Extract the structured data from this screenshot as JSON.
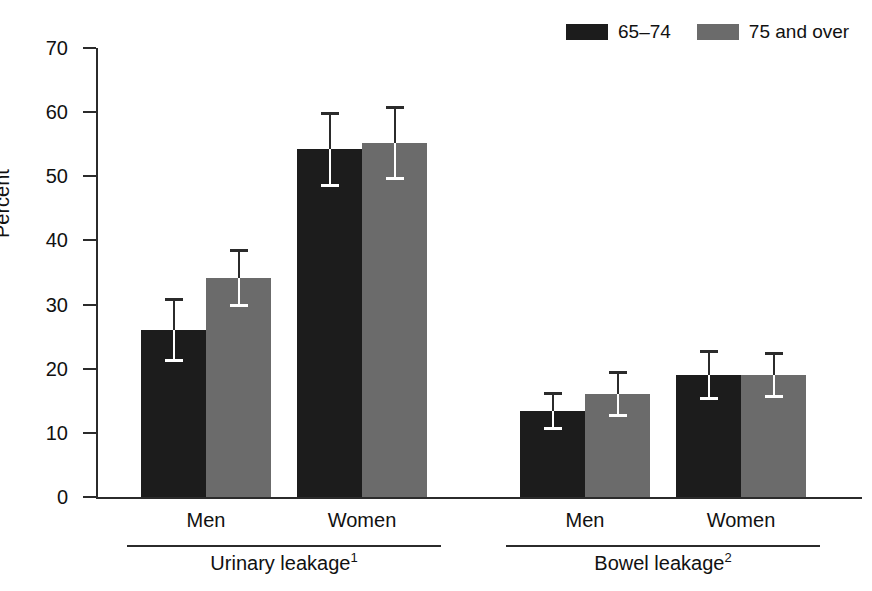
{
  "chart_data": {
    "type": "bar",
    "title": "",
    "subtitle": "",
    "xlabel": "",
    "ylabel": "Percent",
    "ylim": [
      0,
      70
    ],
    "yticks": [
      0,
      10,
      20,
      30,
      40,
      50,
      60,
      70
    ],
    "ytick_labels": [
      "0",
      "10",
      "20",
      "30",
      "40",
      "50",
      "60",
      "70"
    ],
    "grid": false,
    "legend_position": "top-right",
    "orientation": "vertical",
    "error_bars": "95% confidence interval",
    "groups": [
      {
        "name": "Urinary leakage",
        "footnote": "1",
        "categories": [
          "Men",
          "Women"
        ]
      },
      {
        "name": "Bowel leakage",
        "footnote": "2",
        "categories": [
          "Men",
          "Women"
        ]
      }
    ],
    "categories": [
      "Urinary leakage - Men",
      "Urinary leakage - Women",
      "Bowel leakage - Men",
      "Bowel leakage - Women"
    ],
    "series": [
      {
        "name": "65–74",
        "color": "#1c1c1c",
        "values": [
          26.0,
          54.3,
          13.4,
          19.0
        ],
        "err_low": [
          21.0,
          48.3,
          10.4,
          15.1
        ],
        "err_high": [
          31.0,
          60.0,
          16.4,
          22.9
        ]
      },
      {
        "name": "75 and over",
        "color": "#6b6b6b",
        "values": [
          34.1,
          55.2,
          16.0,
          19.0
        ],
        "err_low": [
          29.6,
          49.4,
          12.4,
          15.5
        ],
        "err_high": [
          38.6,
          61.0,
          19.6,
          22.6
        ]
      }
    ]
  },
  "legend": {
    "entries": [
      {
        "label": "65–74",
        "color": "#1c1c1c"
      },
      {
        "label": "75 and over",
        "color": "#6b6b6b"
      }
    ]
  },
  "axis": {
    "y_title": "Percent",
    "y_ticks": [
      "70",
      "60",
      "50",
      "40",
      "30",
      "20",
      "10",
      "0"
    ]
  },
  "x_groups": [
    {
      "label": "Urinary leakage",
      "footnote": "1",
      "categories": [
        "Men",
        "Women"
      ]
    },
    {
      "label": "Bowel leakage",
      "footnote": "2",
      "categories": [
        "Men",
        "Women"
      ]
    }
  ]
}
